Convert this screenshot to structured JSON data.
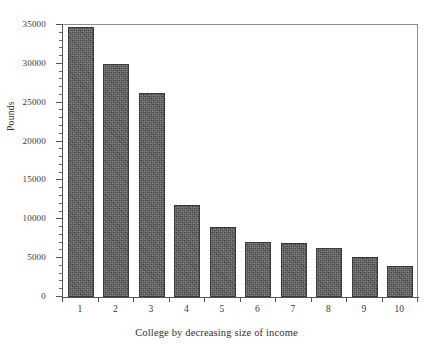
{
  "figure": {
    "clipped_caption_text": "",
    "background_color": "#ffffff",
    "bar_color": "#4a4a4a",
    "axis_color": "#555555",
    "frame_color": "#8d8d8d"
  },
  "chart_data": {
    "type": "bar",
    "title": "",
    "xlabel": "College by decreasing size of income",
    "ylabel": "Pounds",
    "categories": [
      "1",
      "2",
      "3",
      "4",
      "5",
      "6",
      "7",
      "8",
      "9",
      "10"
    ],
    "values": [
      34700,
      30000,
      26300,
      11900,
      9000,
      7100,
      7000,
      6300,
      5100,
      4000
    ],
    "ylim": [
      0,
      35000
    ],
    "ytick_values": [
      0,
      5000,
      10000,
      15000,
      20000,
      25000,
      30000,
      35000
    ],
    "ytick_labels": [
      "0",
      "5000",
      "10000",
      "15000",
      "20000",
      "25000",
      "30000",
      "35000"
    ],
    "yminor_step": 1000,
    "grid": false,
    "legend": null,
    "legend_position": "none",
    "series": [
      {
        "name": "Income",
        "values": [
          34700,
          30000,
          26300,
          11900,
          9000,
          7100,
          7000,
          6300,
          5100,
          4000
        ]
      }
    ]
  }
}
